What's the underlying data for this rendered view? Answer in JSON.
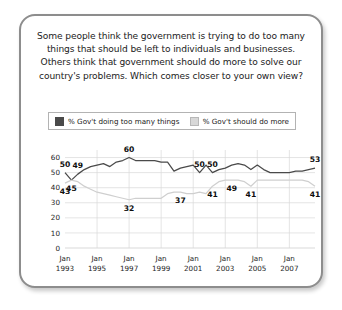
{
  "card": {
    "question": "Some people think the government is trying to do too many things that should be left to individuals and businesses. Others think that government should do more to solve our country's problems. Which comes closer to your own view?"
  },
  "legend": {
    "entries": [
      {
        "label": "% Gov't doing too many things",
        "color": "#4a4a4a",
        "swatch": "dark"
      },
      {
        "label": "% Gov't should do more",
        "color": "#d8d8d8",
        "swatch": "light"
      }
    ]
  },
  "chart_data": {
    "type": "line",
    "title": "Some people think the government is trying to do too many things that should be left to individuals and businesses. Others think that government should do more to solve our country's problems. Which comes closer to your own view?",
    "xlabel": "",
    "ylabel": "",
    "ylim": [
      0,
      65
    ],
    "yticks": [
      0,
      10,
      20,
      30,
      40,
      50,
      60
    ],
    "grid": true,
    "legend_position": "top",
    "xticks": [
      "Jan 1993",
      "Jan 1995",
      "Jan 1997",
      "Jan 1999",
      "Jan 2001",
      "Jan 2003",
      "Jan 2005",
      "Jan 2007"
    ],
    "xtick_indices": [
      0,
      5,
      10,
      15,
      20,
      25,
      30,
      35
    ],
    "n_points": 40,
    "series": [
      {
        "name": "% Gov't doing too many things",
        "color": "#4a4a4a",
        "values": [
          50,
          45,
          49,
          52,
          54,
          55,
          56,
          54,
          57,
          58,
          60,
          58,
          58,
          58,
          58,
          57,
          57,
          51,
          53,
          54,
          55,
          50,
          55,
          50,
          52,
          53,
          55,
          56,
          55,
          52,
          55,
          52,
          50,
          50,
          50,
          50,
          51,
          51,
          52,
          53
        ]
      },
      {
        "name": "% Gov't should do more",
        "color": "#cfcfcf",
        "values": [
          43,
          45,
          44,
          41,
          39,
          37,
          36,
          35,
          34,
          33,
          32,
          33,
          33,
          33,
          33,
          33,
          36,
          37,
          37,
          36,
          36,
          37,
          36,
          41,
          44,
          45,
          45,
          45,
          44,
          41,
          45,
          45,
          45,
          45,
          45,
          45,
          45,
          45,
          44,
          41
        ]
      }
    ],
    "point_labels": [
      {
        "series": 0,
        "index": 0,
        "value": 50
      },
      {
        "series": 0,
        "index": 2,
        "value": 49
      },
      {
        "series": 0,
        "index": 10,
        "value": 60
      },
      {
        "series": 0,
        "index": 21,
        "value": 50
      },
      {
        "series": 0,
        "index": 23,
        "value": 50
      },
      {
        "series": 0,
        "index": 39,
        "value": 53
      },
      {
        "series": 1,
        "index": 0,
        "value": 43
      },
      {
        "series": 1,
        "index": 1,
        "value": 45
      },
      {
        "series": 1,
        "index": 10,
        "value": 32
      },
      {
        "series": 1,
        "index": 18,
        "value": 37
      },
      {
        "series": 1,
        "index": 23,
        "value": 41
      },
      {
        "series": 1,
        "index": 26,
        "value": 49
      },
      {
        "series": 1,
        "index": 29,
        "value": 41
      },
      {
        "series": 1,
        "index": 39,
        "value": 41
      }
    ]
  }
}
